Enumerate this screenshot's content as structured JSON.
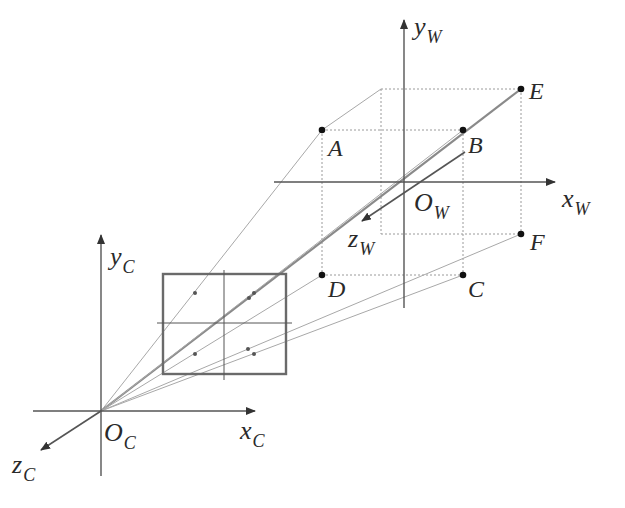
{
  "diagram": {
    "colors": {
      "axis": "#555555",
      "dotted": "#9a9a9a",
      "ray": "#a8a8a8",
      "ray_strong": "#8a8a8a",
      "frame": "#6a6a6a",
      "point": "#111111",
      "text": "#2a2a2a"
    },
    "world_frame": {
      "origin": {
        "label_main": "O",
        "label_sub": "W",
        "x": 404,
        "y": 182
      },
      "x_axis": {
        "label_main": "x",
        "label_sub": "W",
        "from": [
          274,
          182
        ],
        "to": [
          555,
          182
        ]
      },
      "y_axis": {
        "label_main": "y",
        "label_sub": "W",
        "from": [
          404,
          308
        ],
        "to": [
          404,
          20
        ]
      },
      "z_axis": {
        "label_main": "z",
        "label_sub": "W",
        "from": [
          465,
          152
        ],
        "to": [
          362,
          221
        ]
      }
    },
    "camera_frame": {
      "origin": {
        "label_main": "O",
        "label_sub": "C",
        "x": 101,
        "y": 411
      },
      "x_axis": {
        "label_main": "x",
        "label_sub": "C",
        "from": [
          33,
          411
        ],
        "to": [
          255,
          411
        ]
      },
      "y_axis": {
        "label_main": "y",
        "label_sub": "C",
        "from": [
          101,
          476
        ],
        "to": [
          101,
          235
        ]
      },
      "z_axis": {
        "label_main": "z",
        "label_sub": "C",
        "from": [
          101,
          411
        ],
        "to": [
          41,
          450
        ]
      }
    },
    "image_plane": {
      "rect": {
        "x": 163,
        "y": 274,
        "width": 123,
        "height": 100
      },
      "cross_h": {
        "y": 323,
        "x1": 157,
        "x2": 292
      },
      "cross_v": {
        "x": 224,
        "y1": 270,
        "y2": 380
      },
      "projected_points": [
        {
          "name": "A'",
          "x": 195,
          "y": 293
        },
        {
          "name": "B'",
          "x": 249,
          "y": 298
        },
        {
          "name": "E'",
          "x": 254,
          "y": 293
        },
        {
          "name": "D'",
          "x": 195,
          "y": 354
        },
        {
          "name": "C'",
          "x": 248,
          "y": 349
        },
        {
          "name": "F'",
          "x": 254,
          "y": 354
        }
      ]
    },
    "points": [
      {
        "name": "A",
        "x": 322,
        "y": 130,
        "label_dx": 6,
        "label_dy": 6
      },
      {
        "name": "B",
        "x": 463,
        "y": 130,
        "label_dx": 5,
        "label_dy": 3
      },
      {
        "name": "E",
        "x": 521,
        "y": 89,
        "label_dx": 8,
        "label_dy": -10
      },
      {
        "name": "D",
        "x": 322,
        "y": 275,
        "label_dx": 6,
        "label_dy": 2
      },
      {
        "name": "C",
        "x": 463,
        "y": 275,
        "label_dx": 5,
        "label_dy": 2
      },
      {
        "name": "F",
        "x": 521,
        "y": 234,
        "label_dx": 9,
        "label_dy": -4
      }
    ],
    "box_back_corners": {
      "top_left": [
        381,
        89
      ],
      "bottom_left": [
        381,
        234
      ]
    }
  }
}
